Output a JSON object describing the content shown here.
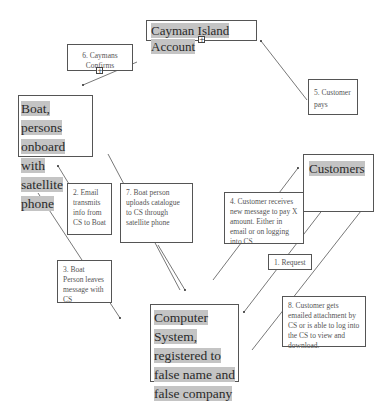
{
  "diagram": {
    "nodes": {
      "cayman": {
        "label": "Cayman Island Account",
        "expand_glyph": "+"
      },
      "boat": {
        "label": "Boat, persons onboard with satellite phone"
      },
      "customers": {
        "label": "Customers"
      },
      "computer_system": {
        "label": "Computer System, registered to false name and false company"
      }
    },
    "steps": {
      "s1": {
        "label": "1. Request"
      },
      "s2": {
        "label": "2. Email transmits info from CS to Boat"
      },
      "s3": {
        "label": "3. Boat Person leaves message with CS"
      },
      "s4": {
        "label": "4. Customer receives new message to pay X amount. Either in email or on logging into CS"
      },
      "s5": {
        "label": "5. Customer pays"
      },
      "s6": {
        "label": "6. Caymans Confirms",
        "expand_glyph": "+"
      },
      "s7": {
        "label": "7. Boat person uploads catalogue to CS through satellite phone"
      },
      "s8": {
        "label": "8. Customer gets emailed attachment by CS or is able to log into the CS to view and download."
      }
    },
    "colors": {
      "line": "#555555",
      "highlight": "#c4c4c4",
      "border": "#555555"
    }
  }
}
